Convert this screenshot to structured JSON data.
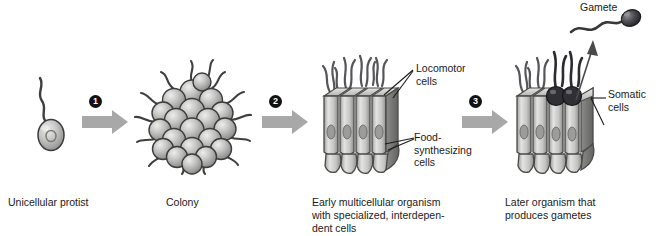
{
  "figure": {
    "background": "#ffffff",
    "theme": "evolution-of-multicellularity",
    "ink_color": "#1a1a1a",
    "arrow_color": "#a8a8a8",
    "cell_fill_light": "#c9c9c9",
    "cell_fill_dark": "#4a4a4a",
    "outline_color": "#3c3c3c"
  },
  "stages": [
    {
      "id": "unicellular-protist",
      "caption": "Unicellular protist",
      "cells": 1,
      "flagella": 1
    },
    {
      "id": "colony",
      "caption": "Colony",
      "cells": 20,
      "flagella": 14
    },
    {
      "id": "early-multicellular-organism",
      "caption": "Early multicellular organism\nwith specialized, interdepen-\ndent cells",
      "labels": [
        {
          "id": "locomotor-cells",
          "text": "Locomotor\ncells"
        },
        {
          "id": "food-synthesizing-cells",
          "text": "Food-\nsynthesizing\ncells"
        }
      ]
    },
    {
      "id": "later-organism",
      "caption": "Later organism that\nproduces gametes",
      "labels": [
        {
          "id": "gamete",
          "text": "Gamete"
        },
        {
          "id": "somatic-cells",
          "text": "Somatic\ncells"
        }
      ]
    }
  ],
  "steps": [
    {
      "number": "1"
    },
    {
      "number": "2"
    },
    {
      "number": "3"
    }
  ]
}
